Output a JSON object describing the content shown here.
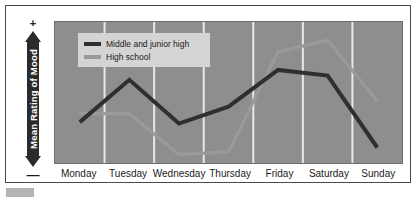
{
  "axis": {
    "y_label": "Mean Rating of Mood",
    "y_positive_sign": "+",
    "y_negative_sign": "—"
  },
  "legend": {
    "entries": [
      {
        "label": "Middle and junior high",
        "color": "#2f2f2f"
      },
      {
        "label": "High school",
        "color": "#9a9a9a"
      }
    ]
  },
  "colors": {
    "plot_background": "#8e8e8e",
    "gridline": "#e8e8e8",
    "card_background": "#ffffff",
    "legend_background": "#d4d4d4",
    "series_middle_junior": "#2f2f2f",
    "series_high_school": "#9a9a9a"
  },
  "chart_data": {
    "type": "line",
    "title": "",
    "xlabel": "",
    "ylabel": "Mean Rating of Mood",
    "grid": true,
    "legend_position": "top-left-inside",
    "ylim": [
      0,
      10
    ],
    "y_axis_note": "Unlabeled ordinal scale running from negative (—) at bottom to positive (+) at top",
    "categories": [
      "Monday",
      "Tuesday",
      "Wednesday",
      "Thursday",
      "Friday",
      "Saturday",
      "Sunday"
    ],
    "series": [
      {
        "name": "Middle and junior high",
        "color": "#2f2f2f",
        "values": [
          2.9,
          5.9,
          2.8,
          4.0,
          6.6,
          6.2,
          1.1
        ]
      },
      {
        "name": "High school",
        "color": "#9a9a9a",
        "values": [
          3.5,
          3.5,
          0.6,
          0.8,
          7.9,
          8.7,
          4.4
        ]
      }
    ]
  }
}
